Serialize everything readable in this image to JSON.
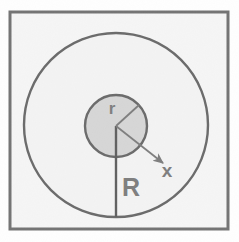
{
  "figure": {
    "canvas": {
      "width": 239,
      "height": 242,
      "background": "#ffffff"
    },
    "frame": {
      "name": "outer-frame",
      "x": 10,
      "y": 12,
      "width": 218,
      "height": 217,
      "fill": "#f2f2f2",
      "stroke": "#3a3a3a",
      "stroke_width": 3
    },
    "outer_circle": {
      "name": "outer-circle",
      "cx": 116,
      "cy": 125,
      "r": 92,
      "fill": "#efefef",
      "stroke": "#2e2e2e",
      "stroke_width": 2.4
    },
    "inner_circle": {
      "name": "inner-circle",
      "cx": 116,
      "cy": 126,
      "r": 31,
      "fill": "#c6c6c6",
      "stroke": "#2e2e2e",
      "stroke_width": 2.4
    },
    "radius_big": {
      "name": "radius-R-line",
      "x1": 116,
      "y1": 126,
      "x2": 116,
      "y2": 217,
      "stroke": "#1f1f1f",
      "stroke_width": 2.4
    },
    "radius_small": {
      "name": "radius-r-line",
      "x1": 116,
      "y1": 126,
      "x2": 139,
      "y2": 105,
      "stroke": "#4a4a4a",
      "stroke_width": 1.8
    },
    "x_arrow": {
      "name": "distance-x-arrow",
      "x1": 116,
      "y1": 126,
      "x2": 163,
      "y2": 163,
      "stroke": "#4a4a4a",
      "stroke_width": 1.8,
      "arrowhead": "true"
    },
    "labels": [
      {
        "name": "label-r",
        "text": "r",
        "x": 112,
        "y": 114,
        "size": 17
      },
      {
        "name": "label-R",
        "text": "R",
        "x": 131,
        "y": 196,
        "size": 25
      },
      {
        "name": "label-x",
        "text": "x",
        "x": 167,
        "y": 177,
        "size": 19
      }
    ],
    "colors": {
      "frame_stroke": "#3a3a3a",
      "circle_stroke": "#2e2e2e",
      "inner_fill": "#c6c6c6",
      "outer_fill": "#efefef",
      "label_color": "#4a4a4a",
      "line_color": "#1f1f1f"
    }
  }
}
